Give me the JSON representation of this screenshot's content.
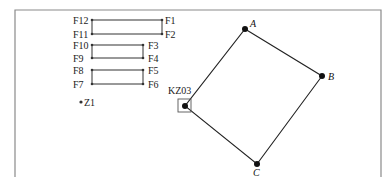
{
  "diagram": {
    "frame": {
      "left": 15,
      "top": 10,
      "right": 381,
      "stroke": "#8a8a8a"
    },
    "pairs": [
      {
        "left_top": "F12",
        "left_bottom": "F11",
        "right_top": "F1",
        "right_bottom": "F2"
      },
      {
        "left_top": "F10",
        "left_bottom": "F9",
        "right_top": "F3",
        "right_bottom": "F4"
      },
      {
        "left_top": "F8",
        "left_bottom": "F7",
        "right_top": "F5",
        "right_bottom": "F6"
      }
    ],
    "standalone_point": {
      "label": "Z1"
    },
    "polygon": {
      "corner_marker_label": "KZ03",
      "vertices": [
        {
          "label": "A",
          "x": 245,
          "y": 29
        },
        {
          "label": "B",
          "x": 322,
          "y": 76
        },
        {
          "label": "C",
          "x": 257,
          "y": 164
        },
        {
          "label": "",
          "x": 185,
          "y": 106
        }
      ]
    }
  }
}
